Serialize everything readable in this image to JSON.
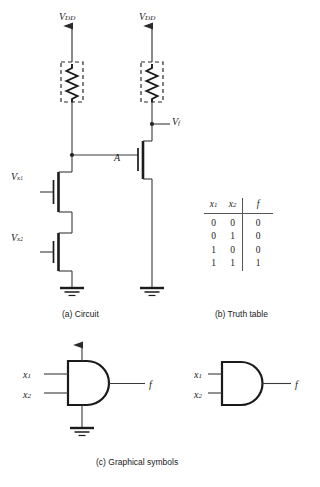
{
  "figure": {
    "title_implied": "NMOS AND gate realization",
    "captions": {
      "a": "(a) Circuit",
      "b": "(b) Truth table",
      "c": "(c) Graphical symbols"
    }
  },
  "circuit": {
    "supply_labels": [
      "VDD",
      "VDD"
    ],
    "supply_text": "V",
    "supply_sub": "DD",
    "output_node": {
      "text": "V",
      "sub": "f"
    },
    "internal_node": "A",
    "gate_inputs": [
      {
        "text": "V",
        "sub": "x",
        "subsub": "1"
      },
      {
        "text": "V",
        "sub": "x",
        "subsub": "2"
      }
    ],
    "load_element": "resistor-pullup-dashed-box",
    "transistor_count": 3,
    "ground_count": 2
  },
  "truth_table": {
    "headers": [
      {
        "text": "x",
        "sub": "1"
      },
      {
        "text": "x",
        "sub": "2"
      },
      {
        "text": "f",
        "sub": ""
      }
    ],
    "rows": [
      {
        "x1": "0",
        "x2": "0",
        "f": "0"
      },
      {
        "x1": "0",
        "x2": "1",
        "f": "0"
      },
      {
        "x1": "1",
        "x2": "0",
        "f": "0"
      },
      {
        "x1": "1",
        "x2": "1",
        "f": "1"
      }
    ]
  },
  "symbols": {
    "gate_left": {
      "type": "and-gate",
      "inputs": [
        {
          "text": "x",
          "sub": "1"
        },
        {
          "text": "x",
          "sub": "2"
        }
      ],
      "output": {
        "text": "f",
        "sub": ""
      },
      "has_vdd_terminal": true,
      "has_ground_terminal": true
    },
    "gate_right": {
      "type": "and-gate",
      "inputs": [
        {
          "text": "x",
          "sub": "1"
        },
        {
          "text": "x",
          "sub": "2"
        }
      ],
      "output": {
        "text": "f",
        "sub": ""
      },
      "has_vdd_terminal": false,
      "has_ground_terminal": false
    }
  },
  "colors": {
    "ink": "#1a1a1a",
    "wire": "#3a3a3a",
    "rule": "#555555",
    "background": "#ffffff"
  }
}
